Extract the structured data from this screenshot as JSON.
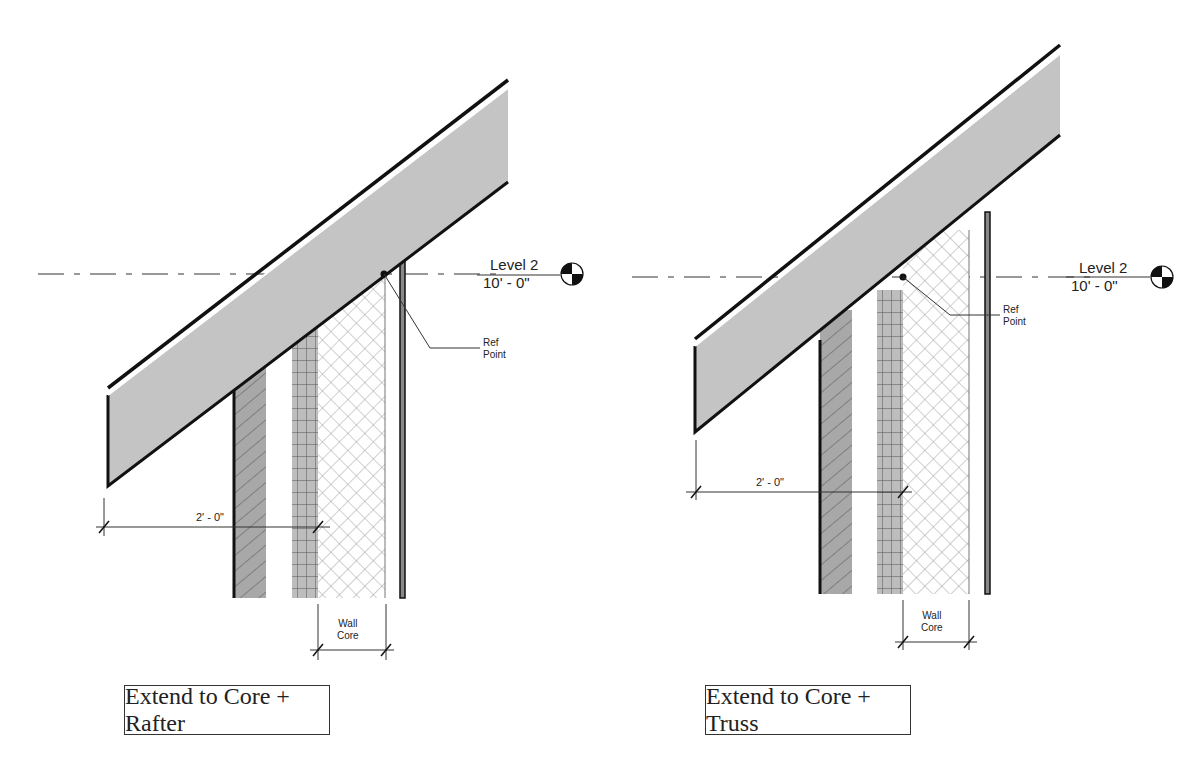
{
  "panels": [
    {
      "id": "rafter",
      "caption": "Extend to Core + Rafter",
      "level": {
        "name": "Level 2",
        "elevation": "10' - 0\""
      },
      "ref_label": [
        "Ref",
        "Point"
      ],
      "overhang_dim": "2' - 0\"",
      "core_label": [
        "Wall",
        "Core"
      ]
    },
    {
      "id": "truss",
      "caption": "Extend to Core + Truss",
      "level": {
        "name": "Level 2",
        "elevation": "10' - 0\""
      },
      "ref_label": [
        "Ref",
        "Point"
      ],
      "overhang_dim": "2' - 0\"",
      "core_label": [
        "Wall",
        "Core"
      ]
    }
  ],
  "colors": {
    "roof_fill": "#c4c4c4",
    "line": "#111111",
    "hatch": "#8a8a8a",
    "masonry": "#b8b8b8",
    "siding": "#9a9a9a"
  }
}
